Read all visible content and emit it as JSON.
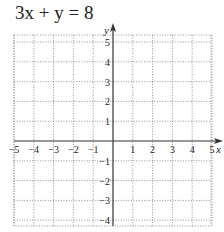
{
  "problem": {
    "equation": "3x + y = 8"
  },
  "chart_data": {
    "type": "line",
    "title": "3x + y = 8",
    "xlabel": "x",
    "ylabel": "y",
    "xlim": [
      -6,
      6
    ],
    "ylim": [
      -6,
      6
    ],
    "x_ticks": [
      -5,
      -4,
      -3,
      -2,
      -1,
      1,
      2,
      3,
      4,
      5
    ],
    "y_ticks": [
      5,
      4,
      3,
      2,
      1,
      -1,
      -2,
      -3,
      -4,
      -5
    ],
    "x_tick_labels": [
      "−5",
      "−4",
      "−3",
      "−2",
      "−1",
      "1",
      "2",
      "3",
      "4",
      "5"
    ],
    "y_tick_labels": [
      "5",
      "4",
      "3",
      "2",
      "1",
      "−1",
      "−2",
      "−3",
      "−4",
      "−5"
    ],
    "grid": true,
    "grid_style": "dotted",
    "series": [],
    "note": "Blank coordinate grid for graphing the equation; no line plotted"
  }
}
